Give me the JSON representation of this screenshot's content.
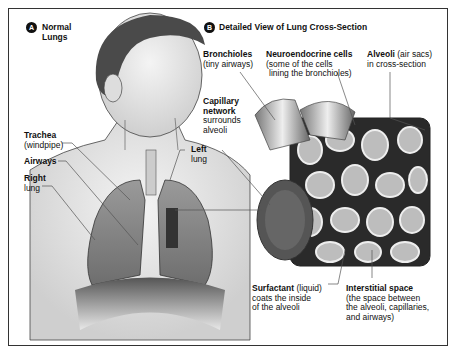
{
  "panel_a": {
    "badge": "A",
    "title_line1": "Normal",
    "title_line2": "Lungs",
    "labels": {
      "trachea": {
        "bold": "Trachea",
        "sub": "(windpipe)"
      },
      "airways": {
        "bold": "Airways"
      },
      "right_lung": {
        "bold": "Right",
        "sub": "lung"
      },
      "left_lung": {
        "bold": "Left",
        "sub": "lung"
      }
    }
  },
  "panel_b": {
    "badge": "B",
    "title": "Detailed View of Lung Cross-Section",
    "labels": {
      "bronchioles": {
        "bold": "Bronchioles",
        "sub": "(tiny airways)"
      },
      "neuroendocrine": {
        "bold": "Neuroendocrine cells",
        "sub1": "(some of the cells",
        "sub2": "lining the bronchioles)"
      },
      "alveoli": {
        "bold": "Alveoli",
        "inline": " (air sacs)",
        "sub": "in cross-section"
      },
      "capillary": {
        "bold1": "Capillary",
        "bold2": "network",
        "sub1": "surrounds",
        "sub2": "alveoli"
      },
      "surfactant": {
        "bold": "Surfactant",
        "inline": " (liquid)",
        "sub1": "coats the inside",
        "sub2": "of the alveoli"
      },
      "interstitial": {
        "bold": "Interstitial space",
        "sub1": "(the space between",
        "sub2": "the alveoli, capillaries,",
        "sub3": "and airways)"
      }
    }
  }
}
